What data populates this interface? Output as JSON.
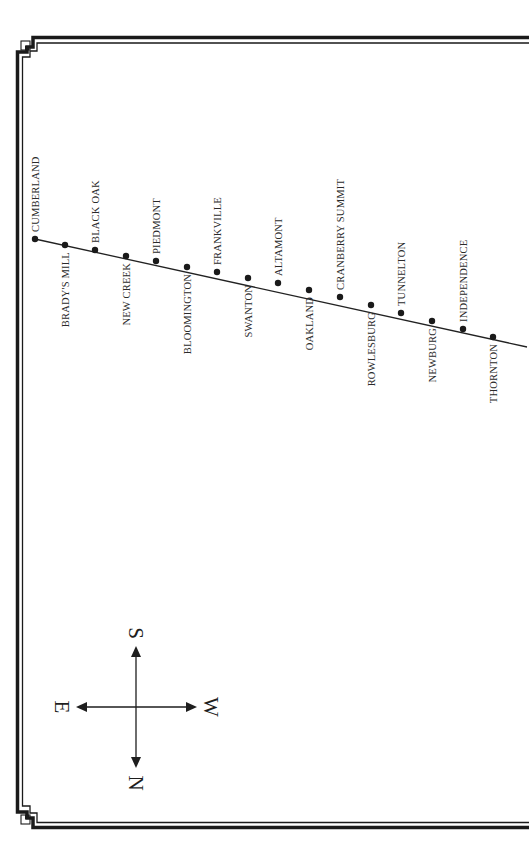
{
  "diagram": {
    "type": "railway-line-map",
    "orientation": "rotated-90",
    "line_start": [
      35,
      239
    ],
    "line_end": [
      527,
      347
    ],
    "stations": [
      {
        "name": "CUMBERLAND",
        "x": 35,
        "y": 239,
        "side": "above"
      },
      {
        "name": "BRADY'S MILL",
        "x": 65,
        "y": 245,
        "side": "below"
      },
      {
        "name": "BLACK OAK",
        "x": 95,
        "y": 250,
        "side": "above"
      },
      {
        "name": "NEW CREEK",
        "x": 126,
        "y": 256,
        "side": "below"
      },
      {
        "name": "PIEDMONT",
        "x": 156,
        "y": 261,
        "side": "above"
      },
      {
        "name": "BLOOMINGTON",
        "x": 187,
        "y": 267,
        "side": "below"
      },
      {
        "name": "FRANKVILLE",
        "x": 217,
        "y": 272,
        "side": "above"
      },
      {
        "name": "SWANTON",
        "x": 248,
        "y": 278,
        "side": "below"
      },
      {
        "name": "ALTAMONT",
        "x": 278,
        "y": 283,
        "side": "above"
      },
      {
        "name": "OAKLAND",
        "x": 309,
        "y": 290,
        "side": "below"
      },
      {
        "name": "CRANBERRY SUMMIT",
        "x": 340,
        "y": 297,
        "side": "above"
      },
      {
        "name": "ROWLESBURG",
        "x": 371,
        "y": 305,
        "side": "below"
      },
      {
        "name": "TUNNELTON",
        "x": 401,
        "y": 313,
        "side": "above"
      },
      {
        "name": "NEWBURG",
        "x": 432,
        "y": 321,
        "side": "below"
      },
      {
        "name": "INDEPENDENCE",
        "x": 463,
        "y": 329,
        "side": "above"
      },
      {
        "name": "THORNTON",
        "x": 493,
        "y": 337,
        "side": "below"
      }
    ]
  },
  "compass": {
    "center": [
      136,
      707
    ],
    "top_label": "S",
    "bottom_label": "N",
    "left_label": "E",
    "right_label": "W"
  },
  "colors": {
    "line": "#222222",
    "border": "#1a1a1a",
    "background": "#ffffff"
  }
}
